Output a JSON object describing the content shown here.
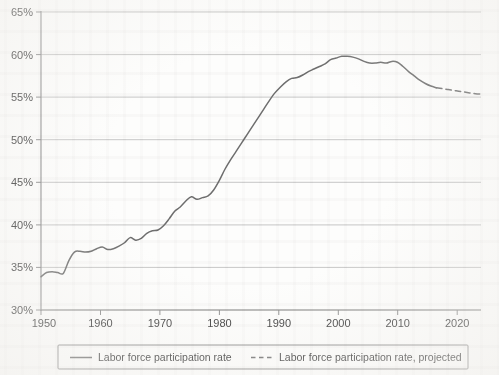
{
  "chart_data": {
    "type": "line",
    "title": "",
    "subtitle": "",
    "xlabel": "",
    "ylabel": "",
    "xlim": [
      1950,
      2024
    ],
    "ylim": [
      30,
      65
    ],
    "grid": true,
    "legend_position": "bottom",
    "x_ticks": [
      "1950",
      "1960",
      "1970",
      "1980",
      "1990",
      "2000",
      "2010",
      "2020"
    ],
    "x_tick_values": [
      1950,
      1960,
      1970,
      1980,
      1990,
      2000,
      2010,
      2020
    ],
    "y_ticks": [
      "30%",
      "35%",
      "40%",
      "45%",
      "50%",
      "55%",
      "60%",
      "65%"
    ],
    "y_tick_values": [
      30,
      35,
      40,
      45,
      50,
      55,
      60,
      65
    ],
    "line_color": "#6e6e6e",
    "grid_color": "#b9b9b9",
    "axis_color": "#8d8d8d",
    "series": [
      {
        "name": "Labor force participation rate",
        "style": "solid",
        "x": [
          1950,
          1951,
          1952,
          1953,
          1954,
          1955,
          1956,
          1957,
          1958,
          1959,
          1960,
          1961,
          1962,
          1963,
          1964,
          1965,
          1966,
          1967,
          1968,
          1969,
          1970,
          1971,
          1972,
          1973,
          1974,
          1975,
          1976,
          1977,
          1978,
          1979,
          1980,
          1981,
          1982,
          1983,
          1984,
          1985,
          1986,
          1987,
          1988,
          1989,
          1990,
          1991,
          1992,
          1993,
          1994,
          1995,
          1996,
          1997,
          1998,
          1999,
          2000,
          2001,
          2002,
          2003,
          2004,
          2005,
          2006,
          2007,
          2008,
          2009,
          2010,
          2011,
          2012,
          2013,
          2014,
          2015
        ],
        "values": [
          33.9,
          34.4,
          34.5,
          34.4,
          34.4,
          35.9,
          36.8,
          36.9,
          36.8,
          36.9,
          37.3,
          37.4,
          37.0,
          37.1,
          37.4,
          37.8,
          38.4,
          38.8,
          39.1,
          39.8,
          40.2,
          40.3,
          40.8,
          41.6,
          42.4,
          42.6,
          43.1,
          44.0,
          45.3,
          46.4,
          47.2,
          47.8,
          48.1,
          48.7,
          49.4,
          50.0,
          50.7,
          51.4,
          52.0,
          52.8,
          53.3,
          53.2,
          53.4,
          53.3,
          54.1,
          54.4,
          54.7,
          55.2,
          55.6,
          56.0,
          56.2,
          56.0,
          55.8,
          55.6,
          55.4,
          55.5,
          55.8,
          56.0,
          56.1,
          55.0,
          54.3,
          53.8,
          53.5,
          53.3,
          53.0,
          52.9
        ],
        "note_values": [
          33.9,
          34.4,
          34.5,
          34.4,
          34.4,
          35.9,
          36.8,
          36.9,
          36.8,
          36.9,
          37.3,
          37.4,
          37.0,
          37.1,
          37.4,
          37.8,
          38.4,
          38.8,
          39.1,
          39.8,
          40.2,
          40.3,
          40.8,
          41.6,
          42.4,
          42.6,
          43.1,
          44.0,
          45.3,
          46.4,
          47.2,
          47.8,
          48.1,
          48.7,
          49.4,
          50.0,
          50.7,
          51.4,
          52.0,
          52.8,
          53.3,
          53.2,
          53.4,
          53.3,
          54.1,
          54.4,
          54.7,
          55.2,
          55.6,
          56.0,
          56.2,
          56.0,
          55.8,
          55.6,
          55.4,
          55.5,
          55.8,
          56.0,
          56.1,
          55.0,
          54.3,
          53.8,
          53.5,
          53.3,
          53.0,
          52.9
        ]
      },
      {
        "name": "Labor force participation rate, projected",
        "style": "dashed",
        "x": [
          2015,
          2016,
          2017,
          2018,
          2019,
          2020,
          2021,
          2022,
          2023,
          2024
        ],
        "values": [
          56.0,
          55.9,
          55.8,
          55.7,
          55.6,
          55.6,
          55.5,
          55.4,
          55.4,
          55.3
        ]
      }
    ],
    "series_plot": {
      "historical": [
        [
          1950,
          33.9
        ],
        [
          1951,
          34.4
        ],
        [
          1952,
          34.5
        ],
        [
          1953,
          34.4
        ],
        [
          1954,
          34.3
        ],
        [
          1955,
          35.8
        ],
        [
          1956,
          36.8
        ],
        [
          1957,
          36.9
        ],
        [
          1958,
          36.8
        ],
        [
          1959,
          36.9
        ],
        [
          1960,
          37.2
        ],
        [
          1961,
          37.4
        ],
        [
          1962,
          37.1
        ],
        [
          1963,
          37.2
        ],
        [
          1964,
          37.5
        ],
        [
          1965,
          37.9
        ],
        [
          1966,
          38.5
        ],
        [
          1967,
          38.2
        ],
        [
          1968,
          38.4
        ],
        [
          1969,
          39.0
        ],
        [
          1970,
          39.3
        ],
        [
          1971,
          39.4
        ],
        [
          1972,
          39.9
        ],
        [
          1973,
          40.7
        ],
        [
          1974,
          41.6
        ],
        [
          1975,
          42.1
        ],
        [
          1976,
          42.8
        ],
        [
          1977,
          43.3
        ],
        [
          1978,
          43.0
        ],
        [
          1979,
          43.2
        ],
        [
          1980,
          43.4
        ],
        [
          1981,
          44.1
        ],
        [
          1982,
          45.2
        ],
        [
          1983,
          46.5
        ],
        [
          1984,
          47.6
        ],
        [
          1985,
          48.6
        ],
        [
          1986,
          49.6
        ],
        [
          1987,
          50.6
        ],
        [
          1988,
          51.6
        ],
        [
          1989,
          52.6
        ],
        [
          1990,
          53.6
        ],
        [
          1991,
          54.6
        ],
        [
          1992,
          55.5
        ],
        [
          1993,
          56.2
        ],
        [
          1994,
          56.8
        ],
        [
          1995,
          57.2
        ],
        [
          1996,
          57.3
        ],
        [
          1997,
          57.6
        ],
        [
          1998,
          58.0
        ],
        [
          1999,
          58.3
        ],
        [
          2000,
          58.6
        ],
        [
          2001,
          58.9
        ],
        [
          2002,
          59.4
        ],
        [
          2003,
          59.6
        ],
        [
          2004,
          59.8
        ],
        [
          2005,
          59.8
        ],
        [
          2006,
          59.7
        ],
        [
          2007,
          59.5
        ],
        [
          2008,
          59.2
        ],
        [
          2009,
          59.0
        ],
        [
          2010,
          59.0
        ],
        [
          2011,
          59.1
        ],
        [
          2012,
          59.0
        ],
        [
          2013,
          59.2
        ],
        [
          2014,
          59.1
        ],
        [
          2015,
          58.6
        ],
        [
          2016,
          58.0
        ],
        [
          2017,
          57.5
        ],
        [
          2018,
          57.0
        ],
        [
          2019,
          56.6
        ],
        [
          2020,
          56.3
        ],
        [
          2021,
          56.1
        ]
      ],
      "projected": [
        [
          2021,
          56.1
        ],
        [
          2022,
          56.0
        ],
        [
          2023,
          55.9
        ],
        [
          2024,
          55.8
        ],
        [
          2025,
          55.7
        ],
        [
          2026,
          55.6
        ],
        [
          2027,
          55.5
        ],
        [
          2028,
          55.4
        ],
        [
          2029,
          55.35
        ]
      ]
    },
    "annotations": []
  },
  "legend": {
    "entries": [
      {
        "label": "Labor force participation rate",
        "style": "solid"
      },
      {
        "label": "Labor force participation rate, projected",
        "style": "dashed"
      }
    ]
  }
}
